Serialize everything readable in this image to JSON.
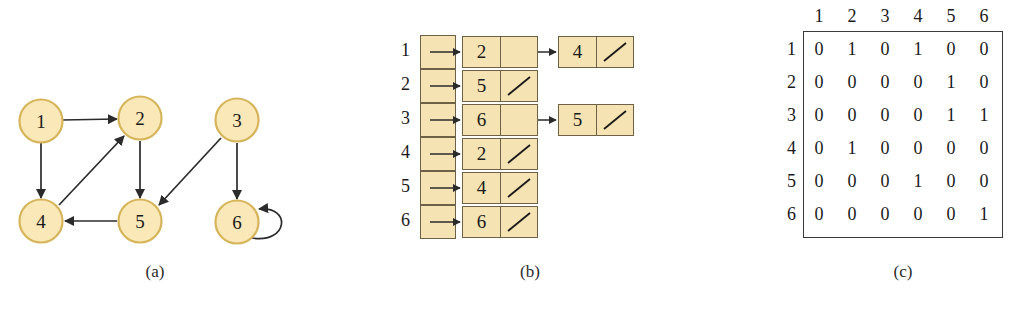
{
  "figure": {
    "captions": {
      "a": "(a)",
      "b": "(b)",
      "c": "(c)"
    }
  },
  "colors": {
    "node_fill": "#fae8b8",
    "node_stroke": "#d6b45a",
    "box_fill": "#f5e3b3",
    "box_stroke": "#6d6147",
    "edge": "#2b2b2b",
    "matrix_border": "#3a3a3a"
  },
  "graph": {
    "vertices": [
      {
        "id": "1",
        "label": "1",
        "cx": 41,
        "cy": 121
      },
      {
        "id": "2",
        "label": "2",
        "cx": 140,
        "cy": 118
      },
      {
        "id": "3",
        "label": "3",
        "cx": 237,
        "cy": 120
      },
      {
        "id": "4",
        "label": "4",
        "cx": 41,
        "cy": 221
      },
      {
        "id": "5",
        "label": "5",
        "cx": 140,
        "cy": 221
      },
      {
        "id": "6",
        "label": "6",
        "cx": 237,
        "cy": 222
      }
    ],
    "edges": [
      {
        "from": "1",
        "to": "2"
      },
      {
        "from": "1",
        "to": "4"
      },
      {
        "from": "2",
        "to": "5"
      },
      {
        "from": "3",
        "to": "5"
      },
      {
        "from": "3",
        "to": "6"
      },
      {
        "from": "4",
        "to": "2"
      },
      {
        "from": "5",
        "to": "4"
      },
      {
        "from": "6",
        "to": "6"
      }
    ]
  },
  "adjacency_list": {
    "row_labels": [
      "1",
      "2",
      "3",
      "4",
      "5",
      "6"
    ],
    "rows": [
      {
        "vertex": "1",
        "nodes": [
          "2",
          "4"
        ]
      },
      {
        "vertex": "2",
        "nodes": [
          "5"
        ]
      },
      {
        "vertex": "3",
        "nodes": [
          "6",
          "5"
        ]
      },
      {
        "vertex": "4",
        "nodes": [
          "2"
        ]
      },
      {
        "vertex": "5",
        "nodes": [
          "4"
        ]
      },
      {
        "vertex": "6",
        "nodes": [
          "6"
        ]
      }
    ],
    "null_symbol": "/"
  },
  "adjacency_matrix": {
    "col_headers": [
      "1",
      "2",
      "3",
      "4",
      "5",
      "6"
    ],
    "row_headers": [
      "1",
      "2",
      "3",
      "4",
      "5",
      "6"
    ],
    "rows": [
      [
        "0",
        "1",
        "0",
        "1",
        "0",
        "0"
      ],
      [
        "0",
        "0",
        "0",
        "0",
        "1",
        "0"
      ],
      [
        "0",
        "0",
        "0",
        "0",
        "1",
        "1"
      ],
      [
        "0",
        "1",
        "0",
        "0",
        "0",
        "0"
      ],
      [
        "0",
        "0",
        "0",
        "1",
        "0",
        "0"
      ],
      [
        "0",
        "0",
        "0",
        "0",
        "0",
        "1"
      ]
    ]
  }
}
